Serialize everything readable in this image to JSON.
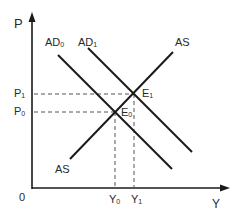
{
  "diagram": {
    "type": "AD-AS model",
    "axes": {
      "y_label": "P",
      "x_label": "Y",
      "origin_label": "0"
    },
    "curves": [
      {
        "id": "ad0",
        "label": "AD",
        "subscript": "0"
      },
      {
        "id": "ad1",
        "label": "AD",
        "subscript": "1"
      },
      {
        "id": "as",
        "label": "AS",
        "label_bottom": "AS"
      }
    ],
    "equilibria": [
      {
        "id": "e0",
        "label": "E",
        "subscript": "0"
      },
      {
        "id": "e1",
        "label": "E",
        "subscript": "1"
      }
    ],
    "price_levels": [
      {
        "id": "p0",
        "label": "P",
        "subscript": "0"
      },
      {
        "id": "p1",
        "label": "P",
        "subscript": "1"
      }
    ],
    "output_levels": [
      {
        "id": "y0",
        "label": "Y",
        "subscript": "0"
      },
      {
        "id": "y1",
        "label": "Y",
        "subscript": "1"
      }
    ],
    "colors": {
      "line": "#1a1a1a",
      "dashed": "#555555"
    }
  }
}
